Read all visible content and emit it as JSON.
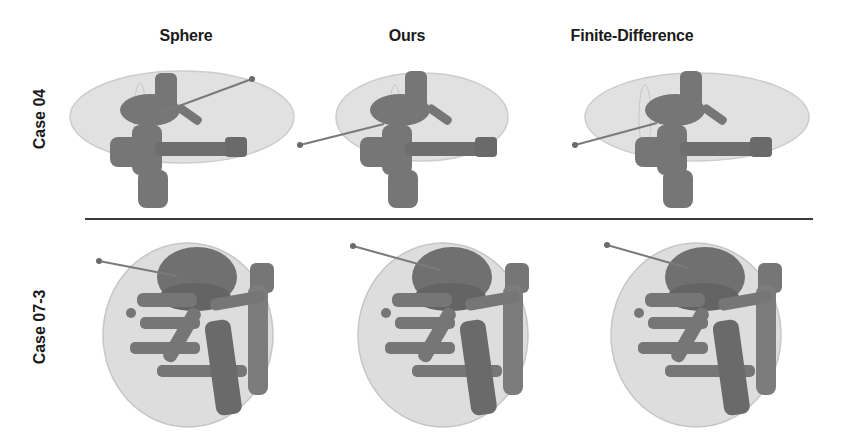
{
  "figure": {
    "columns": [
      {
        "label": "Sphere"
      },
      {
        "label": "Ours"
      },
      {
        "label": "Finite-Difference"
      }
    ],
    "rows": [
      {
        "label": "Case 04"
      },
      {
        "label": "Case 07-3"
      }
    ],
    "colors": {
      "background": "#ffffff",
      "organ_surface": "#d8d8d8",
      "vessel": "#6e6e6e",
      "needle": "#7a7a7a",
      "divider": "#3a3a3a"
    }
  }
}
